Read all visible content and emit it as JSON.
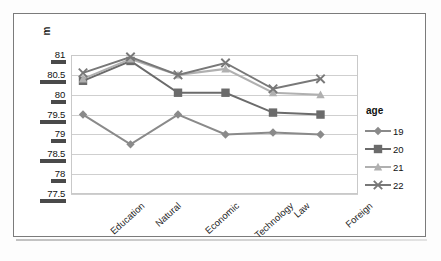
{
  "chart_data": {
    "type": "line",
    "title": "",
    "xlabel": "",
    "ylabel": "m",
    "ylim": [
      77.5,
      81
    ],
    "ytick_labels": [
      "81",
      "80.5",
      "80",
      "79.5",
      "79",
      "78.5",
      "78",
      "77.5"
    ],
    "ytick_values": [
      81,
      80.5,
      80,
      79.5,
      79,
      78.5,
      78,
      77.5
    ],
    "grid": true,
    "legend_position": "right",
    "legend_title": "age",
    "categories": [
      "Education",
      "Natural",
      "Economic",
      "Technology",
      "Law",
      "Foreign"
    ],
    "series": [
      {
        "name": "19",
        "marker": "diamond",
        "color": "#8a8a8a",
        "values": [
          79.5,
          78.75,
          79.5,
          79.0,
          79.05,
          79.0
        ]
      },
      {
        "name": "20",
        "marker": "square",
        "color": "#6b6b6b",
        "values": [
          80.35,
          80.85,
          80.05,
          80.05,
          79.55,
          79.5
        ]
      },
      {
        "name": "21",
        "marker": "triangle",
        "color": "#b0b0b0",
        "values": [
          80.4,
          80.9,
          80.5,
          80.65,
          80.05,
          80.0
        ]
      },
      {
        "name": "22",
        "marker": "cross",
        "color": "#787878",
        "values": [
          80.55,
          80.95,
          80.5,
          80.8,
          80.15,
          80.4
        ]
      }
    ]
  },
  "chart": {
    "y_axis_title": "m",
    "legend": {
      "title": "age",
      "items": [
        {
          "label": "19"
        },
        {
          "label": "20"
        },
        {
          "label": "21"
        },
        {
          "label": "22"
        }
      ]
    },
    "x_labels": [
      "Education",
      "Natural",
      "Economic",
      "Technology",
      "Law",
      "Foreign"
    ],
    "y_labels": [
      "81",
      "80.5",
      "80",
      "79.5",
      "79",
      "78.5",
      "78",
      "77.5"
    ]
  }
}
